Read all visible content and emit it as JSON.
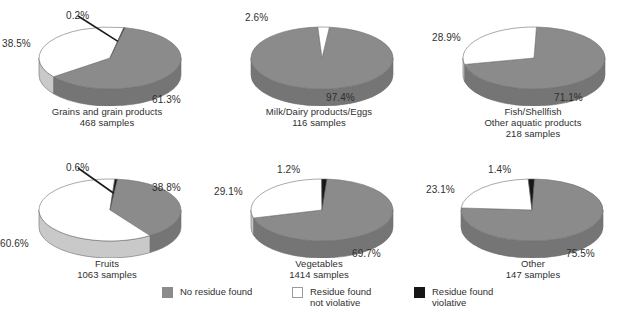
{
  "chart_data": {
    "type": "pie",
    "title": "",
    "legend_position": "bottom",
    "colors": {
      "no_residue": "#8b8b8b",
      "not_violative": "#ffffff",
      "violative": "#161616"
    },
    "legend": [
      {
        "key": "no_residue",
        "label": "No residue found",
        "swatch": "gray"
      },
      {
        "key": "not_violative",
        "label": "Residue found\nnot violative",
        "swatch": "white"
      },
      {
        "key": "violative",
        "label": "Residue found\nviolative",
        "swatch": "black"
      }
    ],
    "series": [
      {
        "name": "No residue found",
        "values": [
          61.3,
          97.4,
          71.1,
          38.8,
          69.7,
          75.5
        ]
      },
      {
        "name": "Residue found not violative",
        "values": [
          38.5,
          2.6,
          28.9,
          60.6,
          29.1,
          23.1
        ]
      },
      {
        "name": "Residue found violative",
        "values": [
          0.2,
          0.0,
          0.0,
          0.6,
          1.2,
          1.4
        ]
      }
    ],
    "categories": [
      "Grains and grain products",
      "Milk/Dairy products/Eggs",
      "Fish/Shellfish Other aquatic products",
      "Fruits",
      "Vegetables",
      "Other"
    ],
    "pies": [
      {
        "id": "grains",
        "caption_lines": [
          "Grains and grain products",
          "468 samples"
        ],
        "samples": 468,
        "slices": [
          {
            "key": "no_residue",
            "label": "61.3%",
            "value": 61.3
          },
          {
            "key": "not_violative",
            "label": "38.5%",
            "value": 38.5
          },
          {
            "key": "violative",
            "label": "0.2%",
            "value": 0.2
          }
        ]
      },
      {
        "id": "milk-dairy-eggs",
        "caption_lines": [
          "Milk/Dairy products/Eggs",
          "116 samples"
        ],
        "samples": 116,
        "slices": [
          {
            "key": "no_residue",
            "label": "97.4%",
            "value": 97.4
          },
          {
            "key": "not_violative",
            "label": "2.6%",
            "value": 2.6
          }
        ]
      },
      {
        "id": "fish-shellfish",
        "caption_lines": [
          "Fish/Shellfish",
          "Other aquatic products",
          "218 samples"
        ],
        "samples": 218,
        "slices": [
          {
            "key": "no_residue",
            "label": "71.1%",
            "value": 71.1
          },
          {
            "key": "not_violative",
            "label": "28.9%",
            "value": 28.9
          }
        ]
      },
      {
        "id": "fruits",
        "caption_lines": [
          "Fruits",
          "1063 samples"
        ],
        "samples": 1063,
        "slices": [
          {
            "key": "no_residue",
            "label": "38.8%",
            "value": 38.8
          },
          {
            "key": "not_violative",
            "label": "60.6%",
            "value": 60.6
          },
          {
            "key": "violative",
            "label": "0.6%",
            "value": 0.6
          }
        ]
      },
      {
        "id": "vegetables",
        "caption_lines": [
          "Vegetables",
          "1414 samples"
        ],
        "samples": 1414,
        "slices": [
          {
            "key": "no_residue",
            "label": "69.7%",
            "value": 69.7
          },
          {
            "key": "not_violative",
            "label": "29.1%",
            "value": 29.1
          },
          {
            "key": "violative",
            "label": "1.2%",
            "value": 1.2
          }
        ]
      },
      {
        "id": "other",
        "caption_lines": [
          "Other",
          "147 samples"
        ],
        "samples": 147,
        "slices": [
          {
            "key": "no_residue",
            "label": "75.5%",
            "value": 75.5
          },
          {
            "key": "not_violative",
            "label": "23.1%",
            "value": 23.1
          },
          {
            "key": "violative",
            "label": "1.4%",
            "value": 1.4
          }
        ]
      }
    ]
  }
}
